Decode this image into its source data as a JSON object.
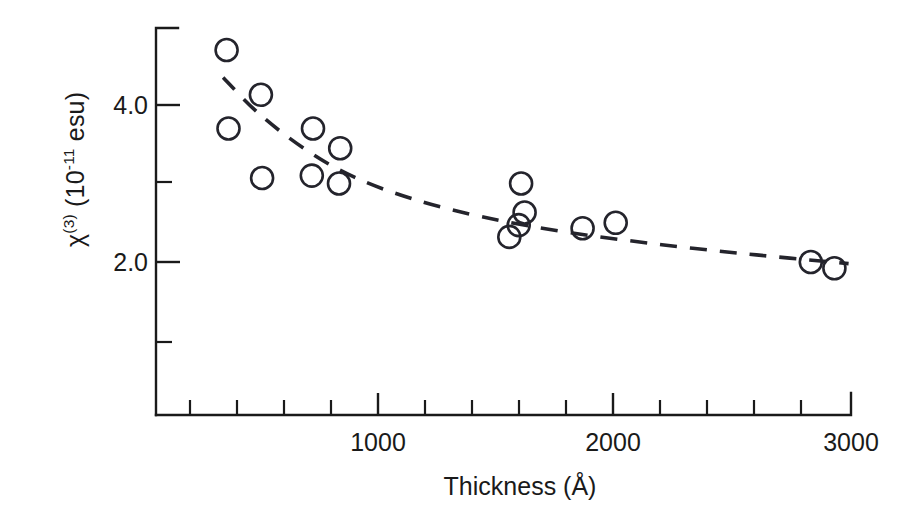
{
  "figure": {
    "background_color": "#ffffff",
    "ink_color": "#1a1a1a",
    "marker_color": "#24242c"
  },
  "labels": {
    "y_axis_title_prefix": "χ",
    "y_axis_title_sup": "(3)",
    "y_axis_title_rest": " (10",
    "y_axis_title_exp": "-11",
    "y_axis_title_tail": " esu)",
    "y_axis_title_plain": "χ(3) (10-11 esu)",
    "x_axis_title": "Thickness (Å)"
  },
  "chart_data": {
    "type": "scatter",
    "title": "",
    "subtitle": "",
    "xlabel": "Thickness (Å)",
    "ylabel": "χ(3) (10^-11 esu)",
    "xlim": [
      50,
      3000
    ],
    "ylim": [
      0.55,
      5.3
    ],
    "grid": false,
    "legend": "none",
    "x_ticks_major": [
      1000,
      2000,
      3000
    ],
    "x_tick_labels": [
      "1000",
      "2000",
      "3000"
    ],
    "x_ticks_minor": [
      200,
      400,
      600,
      800,
      1200,
      1400,
      1600,
      1800,
      2200,
      2400,
      2600,
      2800
    ],
    "y_ticks_major": [
      2.0,
      4.0
    ],
    "y_tick_labels": [
      "2.0",
      "4.0"
    ],
    "y_ticks_minor": [
      1.0,
      3.0
    ],
    "marker_style": "open-circle",
    "marker_radius_px": 11,
    "series": [
      {
        "name": "chi3 vs thickness",
        "points": [
          {
            "x": 360,
            "y": 4.7
          },
          {
            "x": 505,
            "y": 4.13
          },
          {
            "x": 368,
            "y": 3.7
          },
          {
            "x": 510,
            "y": 3.07
          },
          {
            "x": 725,
            "y": 3.7
          },
          {
            "x": 840,
            "y": 3.45
          },
          {
            "x": 720,
            "y": 3.1
          },
          {
            "x": 835,
            "y": 3.0
          },
          {
            "x": 1605,
            "y": 3.0
          },
          {
            "x": 1620,
            "y": 2.63
          },
          {
            "x": 1595,
            "y": 2.47
          },
          {
            "x": 1555,
            "y": 2.32
          },
          {
            "x": 1865,
            "y": 2.43
          },
          {
            "x": 2005,
            "y": 2.5
          },
          {
            "x": 2830,
            "y": 2.0
          },
          {
            "x": 2930,
            "y": 1.92
          }
        ]
      }
    ],
    "fit_curve": {
      "style": "dashed",
      "name": "guide-to-the-eye trend",
      "points": [
        {
          "x": 345,
          "y": 4.35
        },
        {
          "x": 500,
          "y": 3.88
        },
        {
          "x": 700,
          "y": 3.42
        },
        {
          "x": 900,
          "y": 3.08
        },
        {
          "x": 1150,
          "y": 2.8
        },
        {
          "x": 1450,
          "y": 2.57
        },
        {
          "x": 1800,
          "y": 2.38
        },
        {
          "x": 2200,
          "y": 2.22
        },
        {
          "x": 2600,
          "y": 2.09
        },
        {
          "x": 2990,
          "y": 1.98
        }
      ]
    }
  }
}
